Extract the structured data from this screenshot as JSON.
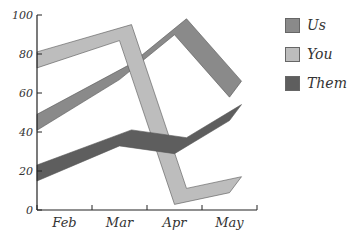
{
  "chart_data": {
    "type": "line",
    "title": "",
    "xlabel": "",
    "ylabel": "",
    "categories": [
      "Feb",
      "Mar",
      "Apr",
      "May"
    ],
    "ylim": [
      0,
      100
    ],
    "yticks": [
      0,
      20,
      40,
      60,
      80,
      100
    ],
    "grid": false,
    "legend_position": "right",
    "style": "3d-ribbon",
    "series": [
      {
        "name": "Us",
        "values": [
          46,
          72,
          95,
          63
        ],
        "color": "#8a8a8a"
      },
      {
        "name": "You",
        "values": [
          78,
          92,
          8,
          14
        ],
        "color": "#bdbdbd"
      },
      {
        "name": "Them",
        "values": [
          20,
          38,
          34,
          51
        ],
        "color": "#5e5e5e"
      }
    ]
  },
  "legend": {
    "items": [
      {
        "label": "Us",
        "color": "#8a8a8a"
      },
      {
        "label": "You",
        "color": "#bdbdbd"
      },
      {
        "label": "Them",
        "color": "#5e5e5e"
      }
    ]
  }
}
